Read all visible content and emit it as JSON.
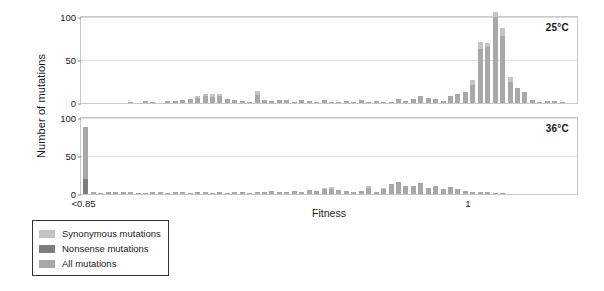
{
  "chart_data": {
    "type": "bar",
    "title": "",
    "xlabel": "Fitness",
    "ylabel": "Number of mutations",
    "xticks": [
      "<0.85",
      "1"
    ],
    "xtick_positions": [
      0.5,
      78
    ],
    "grid": true,
    "legend_position": "below-left",
    "legend": [
      {
        "label": "Synonymous mutations",
        "color": "#c4c4c4"
      },
      {
        "label": "Nonsense mutations",
        "color": "#7d7d7d"
      },
      {
        "label": "All mutations",
        "color": "#a8a8a8"
      }
    ],
    "panels": [
      {
        "tag": "25°C",
        "ylim": [
          0,
          100
        ],
        "yticks": [
          0,
          50,
          100
        ],
        "bars": [
          {
            "x": 0.5,
            "all": 0,
            "syn": 0,
            "non": 0
          },
          {
            "x": 2.0,
            "all": 0,
            "syn": 0,
            "non": 0
          },
          {
            "x": 3.5,
            "all": 0,
            "syn": 0,
            "non": 0
          },
          {
            "x": 5.0,
            "all": 0,
            "syn": 0,
            "non": 0
          },
          {
            "x": 6.5,
            "all": 0,
            "syn": 0,
            "non": 0
          },
          {
            "x": 8.0,
            "all": 0,
            "syn": 0,
            "non": 0
          },
          {
            "x": 9.5,
            "all": 1,
            "syn": 0,
            "non": 0
          },
          {
            "x": 11.0,
            "all": 0,
            "syn": 0,
            "non": 0
          },
          {
            "x": 12.5,
            "all": 2,
            "syn": 0,
            "non": 0
          },
          {
            "x": 14.0,
            "all": 1,
            "syn": 0,
            "non": 0
          },
          {
            "x": 15.5,
            "all": 0,
            "syn": 0,
            "non": 0
          },
          {
            "x": 17.0,
            "all": 2,
            "syn": 0,
            "non": 0
          },
          {
            "x": 18.5,
            "all": 2,
            "syn": 0,
            "non": 0
          },
          {
            "x": 20.0,
            "all": 3,
            "syn": 0,
            "non": 0
          },
          {
            "x": 21.5,
            "all": 5,
            "syn": 0,
            "non": 0
          },
          {
            "x": 23.0,
            "all": 6,
            "syn": 2,
            "non": 0
          },
          {
            "x": 24.5,
            "all": 8,
            "syn": 3,
            "non": 0
          },
          {
            "x": 26.0,
            "all": 7,
            "syn": 3,
            "non": 0
          },
          {
            "x": 27.5,
            "all": 8,
            "syn": 3,
            "non": 0
          },
          {
            "x": 29.0,
            "all": 5,
            "syn": 0,
            "non": 0
          },
          {
            "x": 30.5,
            "all": 3,
            "syn": 0,
            "non": 0
          },
          {
            "x": 32.0,
            "all": 2,
            "syn": 0,
            "non": 0
          },
          {
            "x": 33.5,
            "all": 1,
            "syn": 0,
            "non": 0
          },
          {
            "x": 35.0,
            "all": 9,
            "syn": 5,
            "non": 0
          },
          {
            "x": 36.5,
            "all": 4,
            "syn": 0,
            "non": 0
          },
          {
            "x": 38.0,
            "all": 2,
            "syn": 0,
            "non": 0
          },
          {
            "x": 39.5,
            "all": 3,
            "syn": 0,
            "non": 0
          },
          {
            "x": 41.0,
            "all": 3,
            "syn": 0,
            "non": 0
          },
          {
            "x": 42.5,
            "all": 1,
            "syn": 0,
            "non": 0
          },
          {
            "x": 44.0,
            "all": 3,
            "syn": 0,
            "non": 0
          },
          {
            "x": 45.5,
            "all": 2,
            "syn": 0,
            "non": 0
          },
          {
            "x": 47.0,
            "all": 1,
            "syn": 0,
            "non": 0
          },
          {
            "x": 48.5,
            "all": 3,
            "syn": 0,
            "non": 0
          },
          {
            "x": 50.0,
            "all": 1,
            "syn": 0,
            "non": 0
          },
          {
            "x": 51.5,
            "all": 1,
            "syn": 0,
            "non": 0
          },
          {
            "x": 53.0,
            "all": 2,
            "syn": 0,
            "non": 0
          },
          {
            "x": 54.5,
            "all": 1,
            "syn": 0,
            "non": 0
          },
          {
            "x": 56.0,
            "all": 4,
            "syn": 0,
            "non": 0
          },
          {
            "x": 57.5,
            "all": 1,
            "syn": 0,
            "non": 0
          },
          {
            "x": 59.0,
            "all": 2,
            "syn": 0,
            "non": 0
          },
          {
            "x": 60.5,
            "all": 1,
            "syn": 0,
            "non": 0
          },
          {
            "x": 62.0,
            "all": 1,
            "syn": 0,
            "non": 0
          },
          {
            "x": 63.5,
            "all": 5,
            "syn": 0,
            "non": 0
          },
          {
            "x": 65.0,
            "all": 2,
            "syn": 0,
            "non": 0
          },
          {
            "x": 66.5,
            "all": 5,
            "syn": 0,
            "non": 0
          },
          {
            "x": 68.0,
            "all": 8,
            "syn": 0,
            "non": 0
          },
          {
            "x": 69.5,
            "all": 6,
            "syn": 0,
            "non": 0
          },
          {
            "x": 71.0,
            "all": 5,
            "syn": 0,
            "non": 0
          },
          {
            "x": 72.5,
            "all": 2,
            "syn": 0,
            "non": 0
          },
          {
            "x": 74.0,
            "all": 8,
            "syn": 0,
            "non": 0
          },
          {
            "x": 75.5,
            "all": 11,
            "syn": 0,
            "non": 0
          },
          {
            "x": 77.0,
            "all": 13,
            "syn": 0,
            "non": 0
          },
          {
            "x": 78.5,
            "all": 21,
            "syn": 6,
            "non": 0
          },
          {
            "x": 80.0,
            "all": 63,
            "syn": 8,
            "non": 0
          },
          {
            "x": 81.5,
            "all": 65,
            "syn": 5,
            "non": 0
          },
          {
            "x": 83.0,
            "all": 100,
            "syn": 6,
            "non": 0
          },
          {
            "x": 84.5,
            "all": 78,
            "syn": 9,
            "non": 0
          },
          {
            "x": 86.0,
            "all": 25,
            "syn": 5,
            "non": 0
          },
          {
            "x": 87.5,
            "all": 17,
            "syn": 0,
            "non": 0
          },
          {
            "x": 89.0,
            "all": 13,
            "syn": 0,
            "non": 0
          },
          {
            "x": 90.5,
            "all": 3,
            "syn": 0,
            "non": 0
          },
          {
            "x": 92.0,
            "all": 1,
            "syn": 0,
            "non": 0
          },
          {
            "x": 93.5,
            "all": 2,
            "syn": 0,
            "non": 0
          },
          {
            "x": 95.0,
            "all": 2,
            "syn": 0,
            "non": 0
          },
          {
            "x": 96.5,
            "all": 1,
            "syn": 0,
            "non": 0
          },
          {
            "x": 98.0,
            "all": 0,
            "syn": 0,
            "non": 0
          }
        ]
      },
      {
        "tag": "36°C",
        "ylim": [
          0,
          100
        ],
        "yticks": [
          0,
          50,
          100
        ],
        "bars": [
          {
            "x": 0.5,
            "all": 68,
            "syn": 0,
            "non": 20
          },
          {
            "x": 2.0,
            "all": 3,
            "syn": 0,
            "non": 0
          },
          {
            "x": 3.5,
            "all": 1,
            "syn": 0,
            "non": 0
          },
          {
            "x": 5.0,
            "all": 2,
            "syn": 0,
            "non": 0
          },
          {
            "x": 6.5,
            "all": 2,
            "syn": 0,
            "non": 0
          },
          {
            "x": 8.0,
            "all": 3,
            "syn": 0,
            "non": 0
          },
          {
            "x": 9.5,
            "all": 2,
            "syn": 0,
            "non": 0
          },
          {
            "x": 11.0,
            "all": 1,
            "syn": 0,
            "non": 0
          },
          {
            "x": 12.5,
            "all": 1,
            "syn": 0,
            "non": 0
          },
          {
            "x": 14.0,
            "all": 2,
            "syn": 0,
            "non": 0
          },
          {
            "x": 15.5,
            "all": 2,
            "syn": 0,
            "non": 0
          },
          {
            "x": 17.0,
            "all": 1,
            "syn": 0,
            "non": 0
          },
          {
            "x": 18.5,
            "all": 2,
            "syn": 0,
            "non": 0
          },
          {
            "x": 20.0,
            "all": 2,
            "syn": 0,
            "non": 0
          },
          {
            "x": 21.5,
            "all": 1,
            "syn": 0,
            "non": 0
          },
          {
            "x": 23.0,
            "all": 3,
            "syn": 0,
            "non": 0
          },
          {
            "x": 24.5,
            "all": 2,
            "syn": 0,
            "non": 0
          },
          {
            "x": 26.0,
            "all": 1,
            "syn": 0,
            "non": 0
          },
          {
            "x": 27.5,
            "all": 2,
            "syn": 0,
            "non": 0
          },
          {
            "x": 29.0,
            "all": 1,
            "syn": 0,
            "non": 0
          },
          {
            "x": 30.5,
            "all": 2,
            "syn": 0,
            "non": 0
          },
          {
            "x": 32.0,
            "all": 3,
            "syn": 0,
            "non": 0
          },
          {
            "x": 33.5,
            "all": 1,
            "syn": 0,
            "non": 0
          },
          {
            "x": 35.0,
            "all": 2,
            "syn": 0,
            "non": 0
          },
          {
            "x": 36.5,
            "all": 3,
            "syn": 0,
            "non": 0
          },
          {
            "x": 38.0,
            "all": 4,
            "syn": 0,
            "non": 0
          },
          {
            "x": 39.5,
            "all": 3,
            "syn": 0,
            "non": 0
          },
          {
            "x": 41.0,
            "all": 2,
            "syn": 0,
            "non": 0
          },
          {
            "x": 42.5,
            "all": 4,
            "syn": 0,
            "non": 0
          },
          {
            "x": 44.0,
            "all": 3,
            "syn": 0,
            "non": 0
          },
          {
            "x": 45.5,
            "all": 5,
            "syn": 0,
            "non": 0
          },
          {
            "x": 47.0,
            "all": 4,
            "syn": 0,
            "non": 0
          },
          {
            "x": 48.5,
            "all": 6,
            "syn": 2,
            "non": 0
          },
          {
            "x": 50.0,
            "all": 7,
            "syn": 2,
            "non": 0
          },
          {
            "x": 51.5,
            "all": 5,
            "syn": 0,
            "non": 0
          },
          {
            "x": 53.0,
            "all": 4,
            "syn": 0,
            "non": 0
          },
          {
            "x": 54.5,
            "all": 3,
            "syn": 0,
            "non": 0
          },
          {
            "x": 56.0,
            "all": 4,
            "syn": 0,
            "non": 0
          },
          {
            "x": 57.5,
            "all": 8,
            "syn": 3,
            "non": 0
          },
          {
            "x": 59.0,
            "all": 3,
            "syn": 0,
            "non": 0
          },
          {
            "x": 60.5,
            "all": 6,
            "syn": 2,
            "non": 0
          },
          {
            "x": 62.0,
            "all": 13,
            "syn": 0,
            "non": 0
          },
          {
            "x": 63.5,
            "all": 16,
            "syn": 0,
            "non": 0
          },
          {
            "x": 65.0,
            "all": 11,
            "syn": 0,
            "non": 0
          },
          {
            "x": 66.5,
            "all": 10,
            "syn": 0,
            "non": 0
          },
          {
            "x": 68.0,
            "all": 15,
            "syn": 0,
            "non": 0
          },
          {
            "x": 69.5,
            "all": 8,
            "syn": 0,
            "non": 0
          },
          {
            "x": 71.0,
            "all": 11,
            "syn": 0,
            "non": 0
          },
          {
            "x": 72.5,
            "all": 6,
            "syn": 0,
            "non": 0
          },
          {
            "x": 74.0,
            "all": 9,
            "syn": 0,
            "non": 0
          },
          {
            "x": 75.5,
            "all": 7,
            "syn": 0,
            "non": 0
          },
          {
            "x": 77.0,
            "all": 4,
            "syn": 0,
            "non": 0
          },
          {
            "x": 78.5,
            "all": 3,
            "syn": 0,
            "non": 0
          },
          {
            "x": 80.0,
            "all": 2,
            "syn": 0,
            "non": 0
          },
          {
            "x": 81.5,
            "all": 2,
            "syn": 0,
            "non": 0
          },
          {
            "x": 83.0,
            "all": 1,
            "syn": 0,
            "non": 0
          },
          {
            "x": 84.5,
            "all": 1,
            "syn": 0,
            "non": 0
          },
          {
            "x": 86.0,
            "all": 0,
            "syn": 0,
            "non": 0
          },
          {
            "x": 87.5,
            "all": 0,
            "syn": 0,
            "non": 0
          },
          {
            "x": 89.0,
            "all": 0,
            "syn": 0,
            "non": 0
          },
          {
            "x": 90.5,
            "all": 0,
            "syn": 0,
            "non": 0
          },
          {
            "x": 92.0,
            "all": 0,
            "syn": 0,
            "non": 0
          },
          {
            "x": 93.5,
            "all": 0,
            "syn": 0,
            "non": 0
          },
          {
            "x": 95.0,
            "all": 0,
            "syn": 0,
            "non": 0
          },
          {
            "x": 96.5,
            "all": 0,
            "syn": 0,
            "non": 0
          },
          {
            "x": 98.0,
            "all": 0,
            "syn": 0,
            "non": 0
          }
        ]
      }
    ]
  }
}
